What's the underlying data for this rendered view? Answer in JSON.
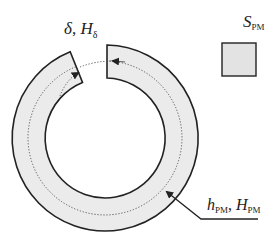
{
  "diagram": {
    "type": "magnetic-ring-with-air-gap",
    "labels": {
      "gap": {
        "symbol": "δ",
        "separator": ", ",
        "field": "H",
        "field_sub": "δ"
      },
      "pm_area": {
        "symbol": "S",
        "sub": "PM"
      },
      "pm_length": {
        "symbol": "h",
        "sub": "PM",
        "separator": ", ",
        "field": "H",
        "field_sub": "PM"
      }
    },
    "colors": {
      "stroke": "#222222",
      "fill": "#ebebeb",
      "flux_path": "#555555",
      "background": "#ffffff"
    },
    "geometry": {
      "center": [
        105,
        138
      ],
      "outer_radius": 93,
      "inner_radius": 60,
      "flux_path_radius": 77
    }
  }
}
